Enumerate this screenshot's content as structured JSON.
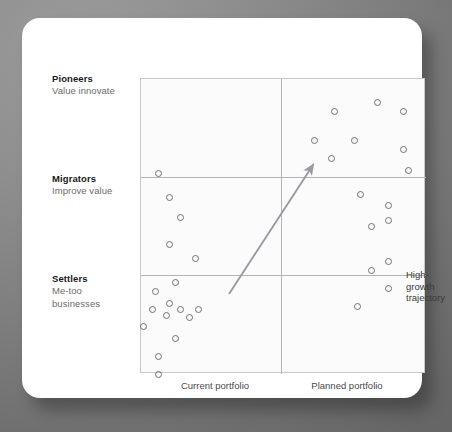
{
  "figure": {
    "row_labels": [
      {
        "title": "Pioneers",
        "subtitle": "Value innovate"
      },
      {
        "title": "Migrators",
        "subtitle": "Improve value"
      },
      {
        "title": "Settlers",
        "subtitle": "Me-too\nbusinesses"
      }
    ],
    "annotation": "High-\ngrowth\ntrajectory",
    "axis": {
      "current": "Current portfolio",
      "planned": "Planned portfolio"
    },
    "colors": {
      "marker_stroke": "#707078",
      "grid_line": "#b4b4b4",
      "frame": "#c9c9c9",
      "arrow": "#9a9aa2",
      "label_title": "#1a1a1a",
      "label_sub": "#6d6d6d",
      "card": "#ffffff",
      "background": "#7e7e7e"
    }
  },
  "chart_data": {
    "type": "scatter",
    "title": "",
    "xlabel": "",
    "ylabel": "",
    "xlim": [
      0,
      2
    ],
    "ylim": [
      0,
      3
    ],
    "grid": true,
    "legend": null,
    "x_categories": [
      "Current portfolio",
      "Planned portfolio"
    ],
    "y_categories": [
      "Settlers",
      "Migrators",
      "Pioneers"
    ],
    "annotations": [
      {
        "text": "High-growth trajectory",
        "type": "arrow",
        "from": {
          "x_pct": 31,
          "y_pct": 73
        },
        "to": {
          "x_pct": 61,
          "y_pct": 30
        }
      }
    ],
    "series": [
      {
        "name": "Business units",
        "marker": "open-circle",
        "points": [
          {
            "quadrant": "Pioneers/Current",
            "x_pct": 6,
            "y_pct": 32
          },
          {
            "quadrant": "Pioneers/Planned",
            "x_pct": 68,
            "y_pct": 11
          },
          {
            "quadrant": "Pioneers/Planned",
            "x_pct": 83,
            "y_pct": 8
          },
          {
            "quadrant": "Pioneers/Planned",
            "x_pct": 92,
            "y_pct": 11
          },
          {
            "quadrant": "Pioneers/Planned",
            "x_pct": 61,
            "y_pct": 21
          },
          {
            "quadrant": "Pioneers/Planned",
            "x_pct": 75,
            "y_pct": 21
          },
          {
            "quadrant": "Pioneers/Planned",
            "x_pct": 92,
            "y_pct": 24
          },
          {
            "quadrant": "Pioneers/Planned",
            "x_pct": 67,
            "y_pct": 27
          },
          {
            "quadrant": "Pioneers/Planned",
            "x_pct": 94,
            "y_pct": 31
          },
          {
            "quadrant": "Migrators/Current",
            "x_pct": 10,
            "y_pct": 40
          },
          {
            "quadrant": "Migrators/Current",
            "x_pct": 14,
            "y_pct": 47
          },
          {
            "quadrant": "Migrators/Current",
            "x_pct": 10,
            "y_pct": 56
          },
          {
            "quadrant": "Migrators/Current",
            "x_pct": 19,
            "y_pct": 61
          },
          {
            "quadrant": "Migrators/Planned",
            "x_pct": 77,
            "y_pct": 39
          },
          {
            "quadrant": "Migrators/Planned",
            "x_pct": 87,
            "y_pct": 43
          },
          {
            "quadrant": "Migrators/Planned",
            "x_pct": 87,
            "y_pct": 48
          },
          {
            "quadrant": "Migrators/Planned",
            "x_pct": 81,
            "y_pct": 50
          },
          {
            "quadrant": "Migrators/Planned",
            "x_pct": 87,
            "y_pct": 62
          },
          {
            "quadrant": "Migrators/Planned",
            "x_pct": 81,
            "y_pct": 65
          },
          {
            "quadrant": "Settlers/Current",
            "x_pct": 12,
            "y_pct": 69
          },
          {
            "quadrant": "Settlers/Current",
            "x_pct": 5,
            "y_pct": 72
          },
          {
            "quadrant": "Settlers/Current",
            "x_pct": 10,
            "y_pct": 76
          },
          {
            "quadrant": "Settlers/Current",
            "x_pct": 4,
            "y_pct": 78
          },
          {
            "quadrant": "Settlers/Current",
            "x_pct": 14,
            "y_pct": 78
          },
          {
            "quadrant": "Settlers/Current",
            "x_pct": 9,
            "y_pct": 80
          },
          {
            "quadrant": "Settlers/Current",
            "x_pct": 20,
            "y_pct": 78
          },
          {
            "quadrant": "Settlers/Current",
            "x_pct": 17,
            "y_pct": 81
          },
          {
            "quadrant": "Settlers/Current",
            "x_pct": 1,
            "y_pct": 84
          },
          {
            "quadrant": "Settlers/Current",
            "x_pct": 12,
            "y_pct": 88
          },
          {
            "quadrant": "Settlers/Current",
            "x_pct": 6,
            "y_pct": 94
          },
          {
            "quadrant": "Settlers/Current",
            "x_pct": 6,
            "y_pct": 100
          },
          {
            "quadrant": "Settlers/Planned",
            "x_pct": 87,
            "y_pct": 71
          },
          {
            "quadrant": "Settlers/Planned",
            "x_pct": 76,
            "y_pct": 77
          }
        ]
      }
    ]
  }
}
